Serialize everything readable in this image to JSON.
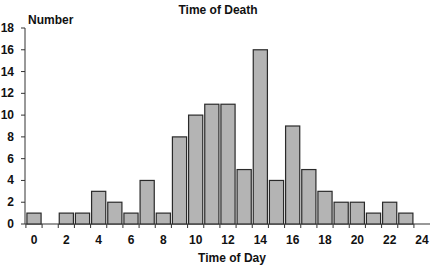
{
  "chart_data": {
    "type": "bar",
    "title": "Time of Death",
    "xlabel": "Time of Day",
    "ylabel": "Number",
    "categories": [
      "0",
      "1",
      "2",
      "3",
      "4",
      "5",
      "6",
      "7",
      "8",
      "9",
      "10",
      "11",
      "12",
      "13",
      "14",
      "15",
      "16",
      "17",
      "18",
      "19",
      "20",
      "21",
      "22",
      "23"
    ],
    "values": [
      1,
      0,
      1,
      1,
      3,
      2,
      1,
      4,
      1,
      8,
      10,
      11,
      11,
      5,
      16,
      4,
      9,
      5,
      3,
      2,
      2,
      1,
      2,
      1
    ],
    "ylim": [
      0,
      18
    ],
    "xlim": [
      0,
      24
    ],
    "yticks": [
      0,
      2,
      4,
      6,
      8,
      10,
      12,
      14,
      16,
      18
    ],
    "xticks": [
      0,
      2,
      4,
      6,
      8,
      10,
      12,
      14,
      16,
      18,
      20,
      22,
      24
    ],
    "grid": false,
    "legend": null,
    "colors": {
      "bar_fill": "#b4b4b4",
      "bar_edge": "#2a2a2a",
      "axis": "#333333",
      "text": "#111111"
    }
  }
}
